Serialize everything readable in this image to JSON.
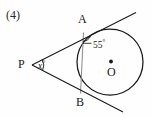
{
  "figure": {
    "item_number": "(4)",
    "background_color": "#fefefe",
    "stroke_color": "#1a1a1a",
    "chord_color": "#8a8a8a"
  },
  "labels": {
    "point_a": "A",
    "point_b": "B",
    "point_p": "P",
    "center_o": "O",
    "angle_at_a_value": "55",
    "angle_at_a_unit": "°",
    "angle_at_p_value": "x",
    "angle_at_p_unit": "°"
  },
  "geometry": {
    "circle": {
      "cx": 110,
      "cy": 62,
      "r": 33
    },
    "point_a": {
      "x": 83.5,
      "y": 32.5
    },
    "point_b": {
      "x": 80.5,
      "y": 93.5
    },
    "point_p": {
      "x": 32,
      "y": 65
    },
    "center_dot": {
      "x": 111,
      "y": 62,
      "r": 1.8
    },
    "tangent_a_extend": {
      "x": 136,
      "y": 13
    },
    "tangent_b_extend": {
      "x": 122,
      "y": 112
    },
    "chord": {
      "x1": 83.5,
      "y1": 32.5,
      "x2": 80.5,
      "y2": 93.5
    }
  }
}
